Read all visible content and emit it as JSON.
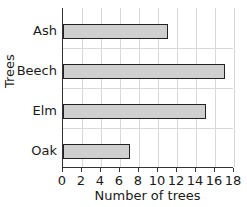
{
  "chart_data": {
    "type": "bar",
    "orientation": "horizontal",
    "title": "",
    "categories": [
      "Ash",
      "Beech",
      "Elm",
      "Oak"
    ],
    "values": [
      11,
      17,
      15,
      7
    ],
    "xlabel": "Number of trees",
    "ylabel": "Trees",
    "xlim": [
      0,
      18
    ],
    "xticks": [
      "0",
      "2",
      "4",
      "6",
      "8",
      "10",
      "12",
      "14",
      "16",
      "18"
    ],
    "grid": true,
    "bar_color": "#cfcfcf",
    "bar_edge_color": "#222222"
  }
}
